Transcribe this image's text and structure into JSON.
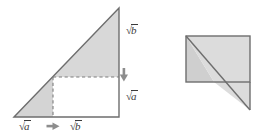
{
  "figure": {
    "colors": {
      "shade_fill": "#d6d6d6",
      "shade_fill_light": "#dcdcdc",
      "stroke": "#6e6e6e",
      "dashed_stroke": "#7a7a7a",
      "label_text": "#3a3a3a",
      "background": "#ffffff",
      "arrow": "#8a8a8a"
    },
    "left_figure": {
      "name": "right-triangle-with-inscribed-rectangle",
      "apex": {
        "x": 119,
        "y": 8
      },
      "bottom_left": {
        "x": 14,
        "y": 117
      },
      "bottom_right": {
        "x": 119,
        "y": 117
      },
      "inner_corner": {
        "x": 53,
        "y": 77
      },
      "description": "Large right triangle, upper shaded trapezoid and lower-left shaded triangle, with a white inscribed rectangle outlined by dashed lines."
    },
    "right_figure": {
      "name": "rearranged-rectangle-with-triangle-tail",
      "rect_top_left": {
        "x": 186,
        "y": 36
      },
      "rect_bottom_right": {
        "x": 250,
        "y": 82
      },
      "tail_tip": {
        "x": 250,
        "y": 110
      },
      "description": "Rectangle with a diagonal from its top-left corner continuing to a point below the bottom-right, forming the rearranged pieces."
    },
    "labels": [
      {
        "id": "label-sqrt-b-right",
        "text": "b",
        "radical": "√",
        "x": 126,
        "y": 30,
        "meaning": "square root of b, vertical upper side"
      },
      {
        "id": "label-sqrt-a-right",
        "text": "a",
        "radical": "√",
        "x": 126,
        "y": 96,
        "meaning": "square root of a, vertical lower side"
      },
      {
        "id": "label-sqrt-a-bottom",
        "text": "a",
        "radical": "√",
        "x": 22,
        "y": 121,
        "meaning": "square root of a, horizontal left segment"
      },
      {
        "id": "label-sqrt-b-bottom",
        "text": "b",
        "radical": "√",
        "x": 72,
        "y": 121,
        "meaning": "square root of b, horizontal right segment"
      }
    ],
    "arrows": [
      {
        "id": "arrow-down",
        "direction": "down",
        "x": 124,
        "y": 77,
        "meaning": "indicates vertical split point"
      },
      {
        "id": "arrow-right",
        "direction": "right",
        "x": 53,
        "y": 126,
        "meaning": "indicates horizontal split point"
      }
    ]
  }
}
